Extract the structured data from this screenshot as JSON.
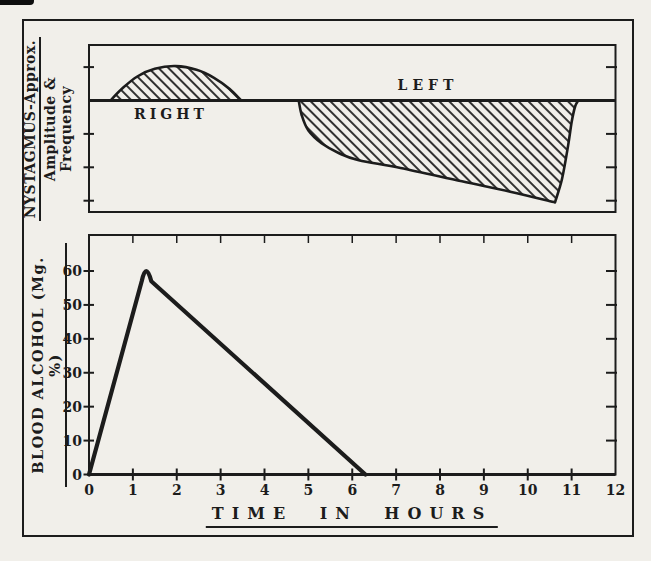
{
  "figure": {
    "ink_color": "#1c1c1c",
    "paper_color": "#f1efea"
  },
  "chart_data": [
    {
      "type": "area",
      "panel": "nystagmus",
      "ylabel_line1": "NYSTAGMUS-Approx.",
      "ylabel_line2": "Amplitude & Frequency",
      "x_range": [
        0,
        12
      ],
      "y_unit": "arbitrary divisions from baseline",
      "y_tick_divisions": [
        1,
        -1,
        -2,
        -3
      ],
      "baseline": 0,
      "hatch": "diagonal-forward-slash",
      "grid": false,
      "regions": [
        {
          "label": "RIGHT",
          "side": "above-baseline",
          "onset_hour": 0.5,
          "peak_hour": 2.0,
          "end_hour": 3.5,
          "peak_divisions": 1.0,
          "outline": [
            [
              [
                0.49,
                0
              ],
              [
                0.75,
                0.35
              ],
              [
                1.1,
                0.72
              ],
              [
                1.5,
                0.95
              ],
              [
                1.98,
                1.03
              ],
              [
                2.45,
                0.92
              ],
              [
                2.85,
                0.68
              ],
              [
                3.2,
                0.35
              ],
              [
                3.47,
                0
              ]
            ]
          ]
        },
        {
          "label": "LEFT",
          "side": "below-baseline",
          "onset_hour": 4.8,
          "deepest_hour": 10.6,
          "end_hour": 11.15,
          "max_divisions": 3.05,
          "outline": [
            [
              [
                4.78,
                0
              ],
              [
                4.85,
                0.45
              ],
              [
                5.0,
                0.9
              ],
              [
                5.3,
                1.28
              ],
              [
                5.7,
                1.58
              ],
              [
                6.15,
                1.79
              ],
              [
                7.1,
                2.02
              ],
              [
                8.5,
                2.42
              ],
              [
                9.6,
                2.73
              ],
              [
                10.62,
                3.05
              ]
            ],
            [
              [
                10.62,
                3.05
              ],
              [
                10.78,
                2.35
              ],
              [
                10.92,
                1.35
              ],
              [
                11.0,
                0.65
              ],
              [
                11.08,
                0.18
              ],
              [
                11.15,
                0
              ]
            ]
          ]
        }
      ]
    },
    {
      "type": "line",
      "panel": "blood-alcohol",
      "xlabel": "TIME IN HOURS",
      "ylabel": "BLOOD ALCOHOL (Mg. %)",
      "x_ticks": [
        0,
        1,
        2,
        3,
        4,
        5,
        6,
        7,
        8,
        9,
        10,
        11,
        12
      ],
      "y_ticks": [
        0,
        10,
        20,
        30,
        40,
        50,
        60
      ],
      "x_range": [
        0,
        12
      ],
      "y_range": [
        0,
        66
      ],
      "grid": false,
      "points": [
        [
          0,
          0
        ],
        [
          1.2,
          57
        ],
        [
          1.3,
          60
        ],
        [
          1.42,
          57
        ],
        [
          6.3,
          0
        ]
      ],
      "peak": {
        "hour": 1.3,
        "value": 60
      },
      "returns_to_zero_hour": 6.3
    }
  ]
}
